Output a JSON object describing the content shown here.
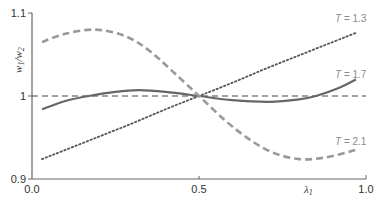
{
  "chart_data": {
    "type": "line",
    "title": "",
    "xlabel": "λ1",
    "ylabel": "w1/w2",
    "xlim": [
      0.0,
      1.0
    ],
    "ylim": [
      0.9,
      1.1
    ],
    "x_ticks": [
      "0.0",
      "0.5",
      "1.0"
    ],
    "y_ticks": [
      "0.9",
      "1",
      "1.1"
    ],
    "grid": false,
    "legend": "inline labels at right end of each curve",
    "reference_line": {
      "y": 1.0,
      "style": "dashed",
      "color": "#444444"
    },
    "series": [
      {
        "name": "T = 1.3",
        "style": "dotted",
        "color": "#555555",
        "x": [
          0.03,
          0.1,
          0.2,
          0.3,
          0.4,
          0.5,
          0.6,
          0.7,
          0.8,
          0.9,
          0.97
        ],
        "values": [
          0.924,
          0.935,
          0.951,
          0.967,
          0.984,
          1.0,
          1.016,
          1.033,
          1.049,
          1.065,
          1.076
        ]
      },
      {
        "name": "T = 1.7",
        "style": "solid",
        "color": "#666666",
        "x": [
          0.03,
          0.1,
          0.17,
          0.25,
          0.32,
          0.4,
          0.5,
          0.6,
          0.71,
          0.8,
          0.85,
          0.92,
          0.97
        ],
        "values": [
          0.984,
          0.994,
          1.0,
          1.005,
          1.007,
          1.005,
          1.0,
          0.995,
          0.993,
          0.996,
          1.0,
          1.01,
          1.02
        ]
      },
      {
        "name": "T = 2.1",
        "style": "dashed",
        "color": "#999999",
        "x": [
          0.03,
          0.1,
          0.19,
          0.28,
          0.35,
          0.42,
          0.5,
          0.58,
          0.65,
          0.72,
          0.8,
          0.88,
          0.97
        ],
        "values": [
          1.065,
          1.075,
          1.08,
          1.072,
          1.055,
          1.03,
          1.0,
          0.97,
          0.948,
          0.932,
          0.924,
          0.926,
          0.935
        ]
      }
    ]
  },
  "labels": {
    "y_axis_main": "w",
    "y_axis_sub1": "1",
    "y_axis_slash": "/w",
    "y_axis_sub2": "2",
    "x_axis_main": "λ",
    "x_axis_sub": "1",
    "series_t13_var": "T",
    "series_t13_val": " = 1.3",
    "series_t17_var": "T",
    "series_t17_val": " = 1.7",
    "series_t21_var": "T",
    "series_t21_val": " = 2.1",
    "tick_y_09": "0.9",
    "tick_y_10": "1",
    "tick_y_11": "1.1",
    "tick_x_00": "0.0",
    "tick_x_05": "0.5",
    "tick_x_10": "1.0"
  }
}
